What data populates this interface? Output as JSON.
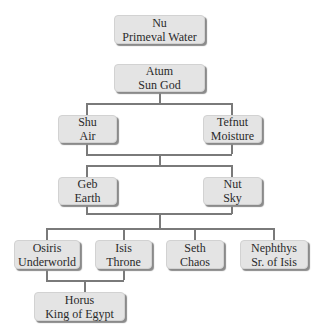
{
  "diagram": {
    "type": "family-tree",
    "nodes": {
      "nu": {
        "name": "Nu",
        "title": "Primeval Water"
      },
      "atum": {
        "name": "Atum",
        "title": "Sun God"
      },
      "shu": {
        "name": "Shu",
        "title": "Air"
      },
      "tefnut": {
        "name": "Tefnut",
        "title": "Moisture"
      },
      "geb": {
        "name": "Geb",
        "title": "Earth"
      },
      "nut": {
        "name": "Nut",
        "title": "Sky"
      },
      "osiris": {
        "name": "Osiris",
        "title": "Underworld"
      },
      "isis": {
        "name": "Isis",
        "title": "Throne"
      },
      "seth": {
        "name": "Seth",
        "title": "Chaos"
      },
      "nephthys": {
        "name": "Nephthys",
        "title": "Sr. of Isis"
      },
      "horus": {
        "name": "Horus",
        "title": "King of Egypt"
      }
    },
    "edges": [
      [
        "atum",
        "shu"
      ],
      [
        "atum",
        "tefnut"
      ],
      [
        "shu+tefnut",
        "geb"
      ],
      [
        "shu+tefnut",
        "nut"
      ],
      [
        "geb+nut",
        "osiris"
      ],
      [
        "geb+nut",
        "isis"
      ],
      [
        "geb+nut",
        "seth"
      ],
      [
        "geb+nut",
        "nephthys"
      ],
      [
        "osiris+isis",
        "horus"
      ]
    ],
    "colors": {
      "box_fill": "#e4e4e4",
      "line": "#7a7a7a",
      "text": "#2a2a2a",
      "background": "#ffffff"
    }
  }
}
